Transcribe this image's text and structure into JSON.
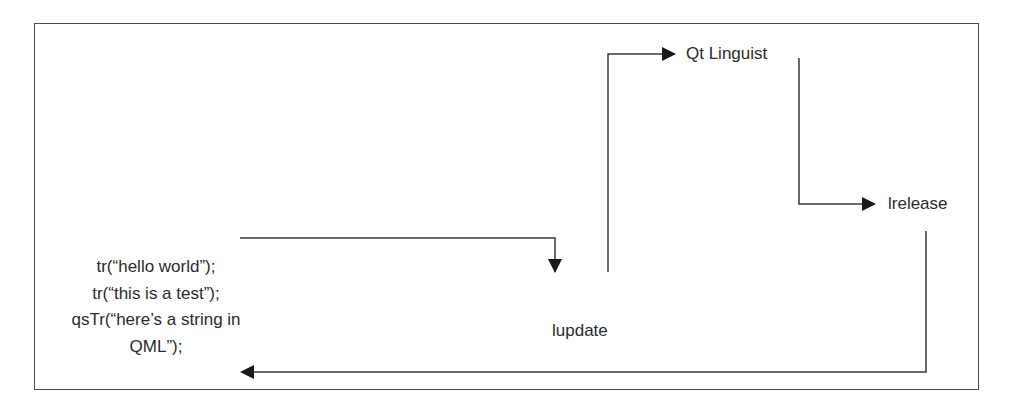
{
  "diagram": {
    "type": "flow",
    "source_code": {
      "lines": [
        "tr(“hello world”);",
        "tr(“this is a test”);",
        "qsTr(“here’s a string in",
        "QML”);"
      ]
    },
    "nodes": {
      "lupdate": "lupdate",
      "qt_linguist": "Qt Linguist",
      "lrelease": "lrelease"
    },
    "edges": [
      {
        "from": "source_code",
        "to": "lupdate"
      },
      {
        "from": "lupdate",
        "to": "qt_linguist"
      },
      {
        "from": "qt_linguist",
        "to": "lrelease"
      },
      {
        "from": "lrelease",
        "to": "source_code"
      }
    ],
    "colors": {
      "line": "#3a3a3a",
      "text": "#2b2b2b",
      "background": "#ffffff",
      "frame": "#4a4a4a"
    }
  }
}
